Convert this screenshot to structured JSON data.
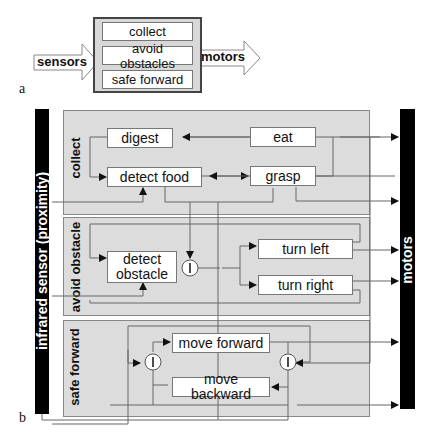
{
  "panel_a": {
    "label": "a",
    "input": "sensors",
    "output": "motors",
    "layers": [
      "collect",
      "avoid obstacles",
      "safe forward"
    ]
  },
  "panel_b": {
    "label": "b",
    "input_bar": "infrared sensor (proximity)",
    "output_bar": "motors",
    "groups": {
      "collect": {
        "title": "collect",
        "nodes": [
          "digest",
          "eat",
          "detect food",
          "grasp"
        ]
      },
      "avoid_obstacle": {
        "title": "avoid obstacle",
        "nodes": [
          "detect obstacle",
          "turn left",
          "turn right"
        ]
      },
      "safe_forward": {
        "title": "safe forward",
        "nodes": [
          "move forward",
          "move backward"
        ]
      }
    },
    "inhibitor_symbol": "I"
  }
}
